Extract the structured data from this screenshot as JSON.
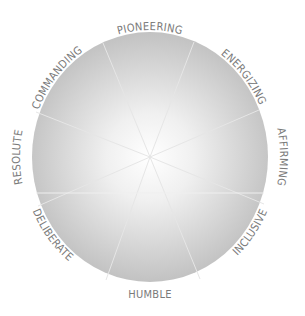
{
  "diagram": {
    "type": "wheel",
    "center": {
      "x": 150,
      "y": 157
    },
    "radius": {
      "x": 118,
      "y": 125
    },
    "colors": {
      "edge": "#c4c4c4",
      "center": "#ffffff",
      "spoke": "#e4e4e4",
      "label": "#7a7a7a"
    },
    "segments": [
      {
        "label": "PIONEERING"
      },
      {
        "label": "ENERGIZING"
      },
      {
        "label": "AFFIRMING"
      },
      {
        "label": "INCLUSIVE"
      },
      {
        "label": "HUMBLE"
      },
      {
        "label": "DELIBERATE"
      },
      {
        "label": "RESOLUTE"
      },
      {
        "label": "COMMANDING"
      }
    ]
  }
}
